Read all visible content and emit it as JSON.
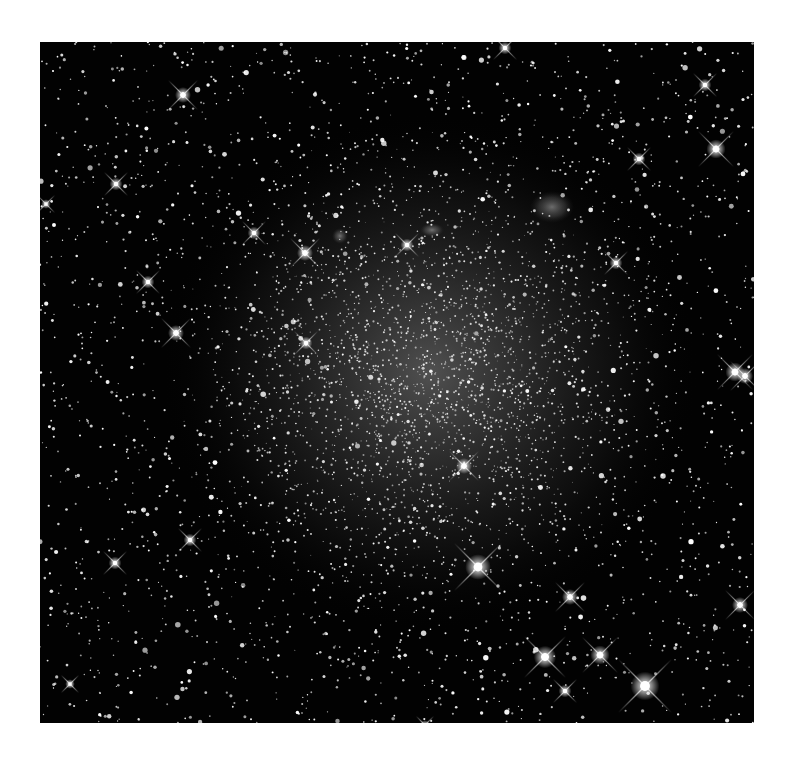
{
  "image": {
    "subject": "Dwarf irregular galaxy star field (grayscale astrophotograph)",
    "frame": {
      "x": 40,
      "y": 42,
      "width": 714,
      "height": 681
    },
    "colors": {
      "page_background": "#ffffff",
      "sky_background": "#020202",
      "galaxy_glow_core": "#5a5a5a",
      "galaxy_glow_mid": "#2e2e2e",
      "star_color": "#ffffff"
    },
    "galaxy": {
      "center_x": 390,
      "center_y": 330,
      "radius_x": 270,
      "radius_y": 260
    },
    "nebulae": [
      {
        "x": 512,
        "y": 165,
        "rx": 22,
        "ry": 16
      },
      {
        "x": 392,
        "y": 188,
        "rx": 12,
        "ry": 7
      },
      {
        "x": 300,
        "y": 194,
        "rx": 8,
        "ry": 8
      }
    ],
    "bright_stars": [
      {
        "x": 143,
        "y": 53,
        "r": 5
      },
      {
        "x": 465,
        "y": 6,
        "r": 4
      },
      {
        "x": 676,
        "y": 107,
        "r": 6
      },
      {
        "x": 599,
        "y": 117,
        "r": 4
      },
      {
        "x": 576,
        "y": 221,
        "r": 4
      },
      {
        "x": 695,
        "y": 330,
        "r": 6
      },
      {
        "x": 705,
        "y": 334,
        "r": 5
      },
      {
        "x": 700,
        "y": 563,
        "r": 5
      },
      {
        "x": 438,
        "y": 525,
        "r": 8
      },
      {
        "x": 505,
        "y": 615,
        "r": 7
      },
      {
        "x": 560,
        "y": 613,
        "r": 6
      },
      {
        "x": 605,
        "y": 644,
        "r": 9
      },
      {
        "x": 530,
        "y": 555,
        "r": 5
      },
      {
        "x": 525,
        "y": 649,
        "r": 4
      },
      {
        "x": 75,
        "y": 521,
        "r": 4
      },
      {
        "x": 150,
        "y": 498,
        "r": 4
      },
      {
        "x": 265,
        "y": 211,
        "r": 5
      },
      {
        "x": 214,
        "y": 191,
        "r": 4
      },
      {
        "x": 136,
        "y": 291,
        "r": 5
      },
      {
        "x": 108,
        "y": 240,
        "r": 4
      },
      {
        "x": 266,
        "y": 301,
        "r": 4
      },
      {
        "x": 424,
        "y": 424,
        "r": 5
      },
      {
        "x": 367,
        "y": 203,
        "r": 4
      },
      {
        "x": 76,
        "y": 142,
        "r": 4
      },
      {
        "x": 30,
        "y": 642,
        "r": 3
      },
      {
        "x": 665,
        "y": 43,
        "r": 4
      },
      {
        "x": 6,
        "y": 162,
        "r": 3
      },
      {
        "x": 385,
        "y": 683,
        "r": 3
      }
    ],
    "field_star_seed": 6822,
    "field_star_count": 2600,
    "galaxy_star_count": 2200
  }
}
